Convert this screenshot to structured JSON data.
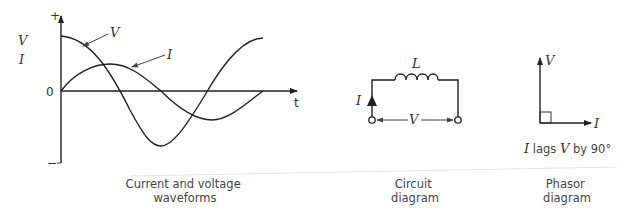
{
  "waveforms": {
    "y_label_v": "V",
    "y_label_i": "I",
    "plus_sign": "+",
    "minus_sign": "−",
    "zero_label": "0",
    "x_label": "t",
    "curve_label_v": "V",
    "curve_label_i": "I",
    "caption_line1": "Current and voltage",
    "caption_line2": "waveforms"
  },
  "circuit": {
    "inductor_label": "L",
    "current_label": "I",
    "voltage_label": "V",
    "caption_line1": "Circuit",
    "caption_line2": "diagram"
  },
  "phasor": {
    "v_label": "V",
    "i_label": "I",
    "note_i": "I",
    "note_mid": " lags ",
    "note_v": "V",
    "note_end": " by 90°",
    "caption_line1": "Phasor",
    "caption_line2": "diagram"
  }
}
